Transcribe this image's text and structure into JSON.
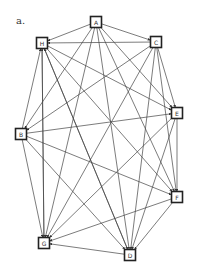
{
  "panel_label": "a.",
  "colors": {
    "edge": "#444444",
    "node_border": "#222222",
    "background": "#ffffff"
  },
  "nodes": [
    {
      "id": "A",
      "label": "A",
      "x": 96,
      "y": 22
    },
    {
      "id": "C",
      "label": "C",
      "x": 156,
      "y": 42
    },
    {
      "id": "H",
      "label": "H",
      "x": 42,
      "y": 43
    },
    {
      "id": "E",
      "label": "E",
      "x": 177,
      "y": 113
    },
    {
      "id": "B",
      "label": "B",
      "x": 21,
      "y": 134
    },
    {
      "id": "F",
      "label": "F",
      "x": 177,
      "y": 197
    },
    {
      "id": "G",
      "label": "G",
      "x": 44,
      "y": 243
    },
    {
      "id": "D",
      "label": "D",
      "x": 130,
      "y": 255
    }
  ],
  "edges": [
    [
      "A",
      "H"
    ],
    [
      "A",
      "C"
    ],
    [
      "A",
      "B"
    ],
    [
      "A",
      "G"
    ],
    [
      "A",
      "D"
    ],
    [
      "A",
      "E"
    ],
    [
      "A",
      "F"
    ],
    [
      "C",
      "H"
    ],
    [
      "C",
      "B"
    ],
    [
      "C",
      "G"
    ],
    [
      "C",
      "D"
    ],
    [
      "C",
      "E"
    ],
    [
      "C",
      "F"
    ],
    [
      "H",
      "E"
    ],
    [
      "H",
      "F"
    ],
    [
      "H",
      "D"
    ],
    [
      "H",
      "G"
    ],
    [
      "B",
      "H"
    ],
    [
      "B",
      "E"
    ],
    [
      "B",
      "F"
    ],
    [
      "B",
      "G"
    ],
    [
      "B",
      "D"
    ],
    [
      "E",
      "F"
    ],
    [
      "E",
      "G"
    ],
    [
      "E",
      "D"
    ],
    [
      "F",
      "G"
    ],
    [
      "F",
      "D"
    ],
    [
      "D",
      "G"
    ],
    [
      "D",
      "H"
    ],
    [
      "G",
      "H"
    ]
  ]
}
